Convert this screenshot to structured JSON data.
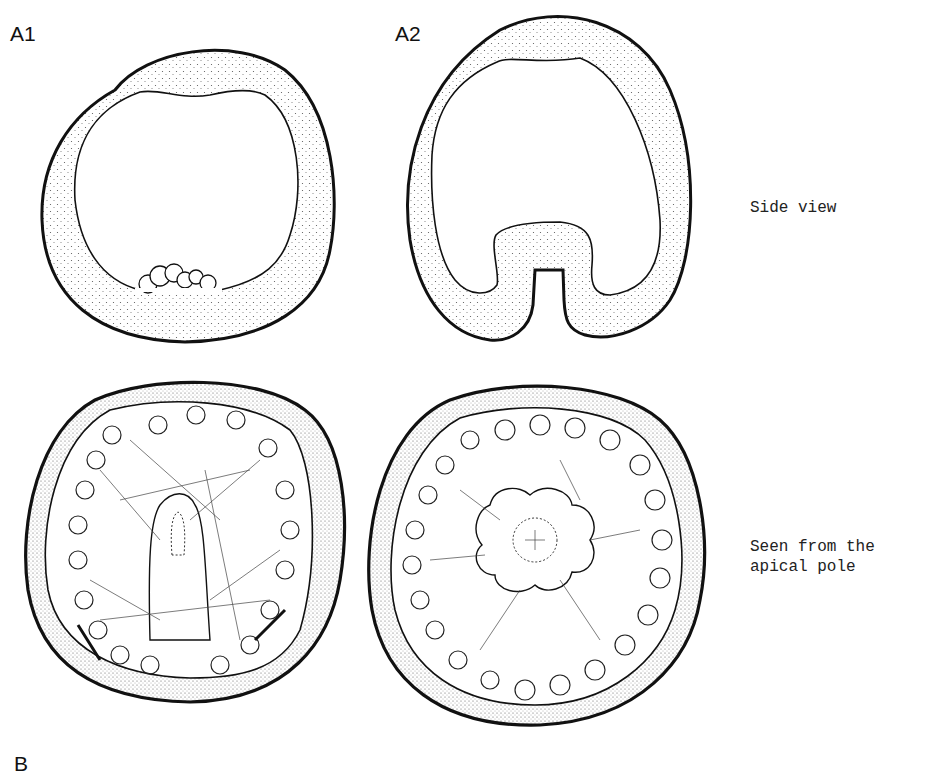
{
  "figure": {
    "panels": {
      "a1": {
        "label": "A1"
      },
      "a2": {
        "label": "A2"
      },
      "b": {
        "label": "B"
      }
    },
    "row_captions": {
      "side_view": "Side view",
      "apical_line1": "Seen from the",
      "apical_line2": "apical pole"
    },
    "colors": {
      "ink": "#111111",
      "stipple": "#555555",
      "background": "#ffffff"
    }
  }
}
